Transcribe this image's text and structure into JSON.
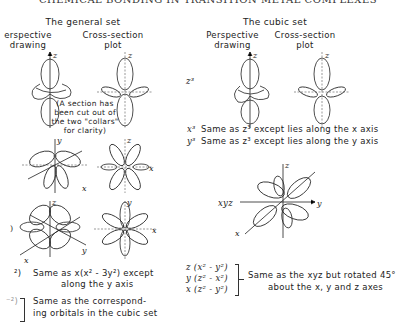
{
  "header": {
    "title": "CHEMICAL BONDING IN TRANSITION METAL COMPLEXES"
  },
  "general_set": {
    "title": "The general set",
    "col1": [
      "erspective",
      "drawing"
    ],
    "col2": [
      "Cross-section",
      "plot"
    ],
    "note": [
      "(A section has",
      "been cut out of",
      "the two \"collars\"",
      "for clarity)"
    ],
    "axis_labels": {
      "z": "z",
      "y": "y",
      "x": "x"
    },
    "caption1": {
      "prefix": "²)",
      "line1": "Same as x(x² - 3y²) except",
      "line2": "along the y axis"
    },
    "caption2": {
      "prefix": "⁻²)",
      "line1": "Same as the correspond-",
      "line2": "ing orbitals in the cubic set"
    }
  },
  "cubic_set": {
    "title": "The cubic set",
    "col1": [
      "Perspective",
      "drawing"
    ],
    "col2": [
      "Cross-section",
      "plot"
    ],
    "z3_label": "z³",
    "x3_label": "x³",
    "x3_text": "Same as z³ except lies along the x axis",
    "y3_label": "y³",
    "y3_text": "Same as z³ except lies along the y axis",
    "xyz_label": "xyz",
    "group_labels": [
      "z (x² - y²)",
      "y (z² - x²)",
      "x (z² - y²)"
    ],
    "group_text": [
      "Same as the xyz but rotated 45°",
      "about the x, y and z axes"
    ],
    "axis_labels": {
      "z": "z",
      "y": "y",
      "x": "x"
    }
  }
}
